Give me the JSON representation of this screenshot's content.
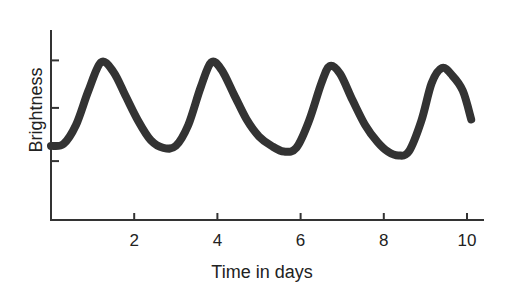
{
  "chart_data": {
    "type": "line",
    "title": "",
    "xlabel": "Time in days",
    "ylabel": "Brightness",
    "xlim": [
      0,
      10.3
    ],
    "ylim": [
      0,
      100
    ],
    "x_ticks": [
      2,
      4,
      6,
      8,
      10
    ],
    "x_tick_labels": [
      "2",
      "4",
      "6",
      "8",
      "10"
    ],
    "y_ticks": [
      31,
      59,
      84
    ],
    "y_tick_labels": [
      "",
      "",
      ""
    ],
    "grid": false,
    "legend": null,
    "series": [
      {
        "name": "Brightness",
        "color": "#333333",
        "x": [
          0.0,
          0.3,
          0.6,
          0.9,
          1.2,
          1.5,
          1.8,
          2.1,
          2.4,
          2.7,
          3.0,
          3.3,
          3.6,
          3.85,
          4.1,
          4.4,
          4.7,
          5.0,
          5.3,
          5.6,
          5.9,
          6.2,
          6.5,
          6.7,
          6.95,
          7.25,
          7.55,
          7.85,
          8.1,
          8.35,
          8.6,
          8.9,
          9.15,
          9.4,
          9.65,
          9.9,
          10.1
        ],
        "values": [
          39,
          40,
          50,
          68,
          83,
          78,
          65,
          52,
          42,
          38,
          39,
          50,
          70,
          83,
          79,
          66,
          53,
          44,
          39,
          36,
          38,
          52,
          72,
          81,
          77,
          63,
          50,
          41,
          36,
          34,
          36,
          52,
          72,
          80,
          76,
          68,
          53
        ]
      }
    ]
  },
  "labels": {
    "xlabel": "Time in days",
    "ylabel": "Brightness",
    "xticks": [
      "2",
      "4",
      "6",
      "8",
      "10"
    ]
  }
}
